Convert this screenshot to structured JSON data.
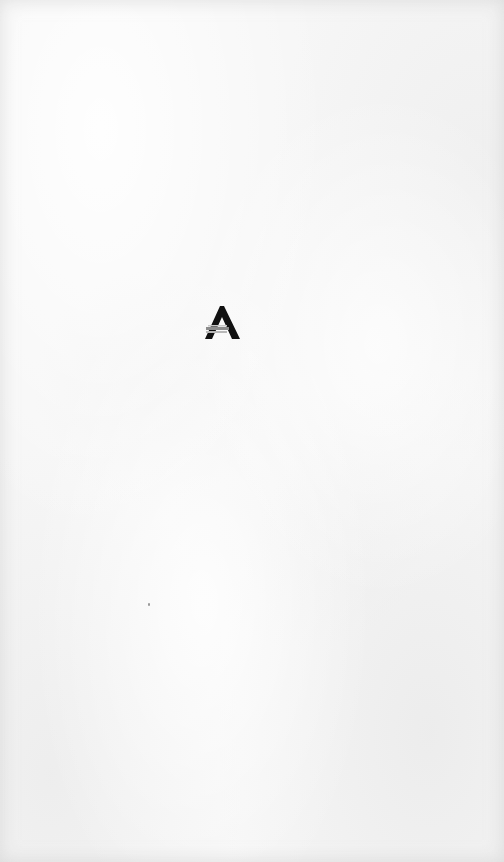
{
  "screen": {
    "type": "splash",
    "background": "paper-texture"
  },
  "logo": {
    "icon": "brand-a-triangle-logo",
    "primary_color": "#111111",
    "stripe_color": "#8c8c8c"
  },
  "colors": {
    "background": "#f6f6f6"
  }
}
